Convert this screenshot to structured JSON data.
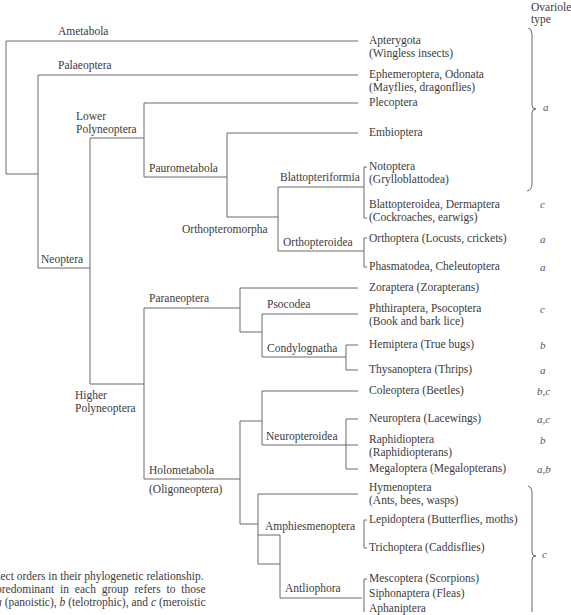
{
  "header": {
    "ovariole_type_line1": "Ovariole",
    "ovariole_type_line2": "type"
  },
  "clades": {
    "ametabola": "Ametabola",
    "palaeoptera": "Palaeoptera",
    "neoptera": "Neoptera",
    "lower_polyneoptera_1": "Lower",
    "lower_polyneoptera_2": "Polyneoptera",
    "paurometabola": "Paurometabola",
    "orthopteromorpha": "Orthopteromorpha",
    "blattopteriformia": "Blattopteriformia",
    "orthopteroidea": "Orthopteroidea",
    "higher_polyneoptera_1": "Higher",
    "higher_polyneoptera_2": "Polyneoptera",
    "paraneoptera": "Paraneoptera",
    "psocodea": "Psocodea",
    "condylognatha": "Condylognatha",
    "holometabola": "Holometabola",
    "oligoneoptera": "(Oligoneoptera)",
    "neuropteroidea": "Neuropteroidea",
    "amphiesmenoptera": "Amphiesmenoptera",
    "antliophora": "Antliophora"
  },
  "taxa": [
    {
      "line1": "Apterygota",
      "line2": "(Wingless insects)",
      "ovariole": ""
    },
    {
      "line1": "Ephemeroptera, Odonata",
      "line2": "(Mayflies, dragonflies)",
      "ovariole": ""
    },
    {
      "line1": "Plecoptera",
      "line2": "",
      "ovariole": ""
    },
    {
      "line1": "Embioptera",
      "line2": "",
      "ovariole": ""
    },
    {
      "line1": "Notoptera",
      "line2": "(Grylloblattodea)",
      "ovariole": ""
    },
    {
      "line1": "Blattopteroidea, Dermaptera",
      "line2": "(Cockroaches, earwigs)",
      "ovariole": "c"
    },
    {
      "line1": "Orthoptera (Locusts, crickets)",
      "line2": "",
      "ovariole": "a"
    },
    {
      "line1": "Phasmatodea, Cheleutoptera",
      "line2": "",
      "ovariole": "a"
    },
    {
      "line1": "Zoraptera (Zorapterans)",
      "line2": "",
      "ovariole": ""
    },
    {
      "line1": "Phthiraptera, Psocoptera",
      "line2": "(Book and bark lice)",
      "ovariole": "c"
    },
    {
      "line1": "Hemiptera (True bugs)",
      "line2": "",
      "ovariole": "b"
    },
    {
      "line1": "Thysanoptera (Thrips)",
      "line2": "",
      "ovariole": "a"
    },
    {
      "line1": "Coleoptera (Beetles)",
      "line2": "",
      "ovariole": "b,c"
    },
    {
      "line1": "Neuroptera (Lacewings)",
      "line2": "",
      "ovariole": "a,c"
    },
    {
      "line1": "Raphidioptera",
      "line2": "(Raphidiopterans)",
      "ovariole": "b"
    },
    {
      "line1": "Megaloptera (Megalopterans)",
      "line2": "",
      "ovariole": "a,b"
    },
    {
      "line1": "Hymenoptera",
      "line2": "(Ants, bees, wasps)",
      "ovariole": ""
    },
    {
      "line1": "Lepidoptera (Butterflies, moths)",
      "line2": "",
      "ovariole": ""
    },
    {
      "line1": "Trichoptera (Caddisflies)",
      "line2": "",
      "ovariole": ""
    },
    {
      "line1": "Mescoptera (Scorpions)",
      "line2": "",
      "ovariole": ""
    },
    {
      "line1": "Siphonaptera (Fleas)",
      "line2": "",
      "ovariole": ""
    },
    {
      "line1": "Aphaniptera",
      "line2": "",
      "ovariole": ""
    }
  ],
  "braces": [
    {
      "label": "a",
      "covers": "Apterygota through Notoptera"
    },
    {
      "label": "c",
      "covers": "Hymenoptera through Aphaniptera"
    }
  ],
  "caption": {
    "line1": "sect orders in their phylogenetic relationship.",
    "line2": "predominant in each group refers to those",
    "line3_a": "a",
    "line3_a_text": " (panoistic), ",
    "line3_b": "b",
    "line3_b_text": " (telotrophic), and ",
    "line3_c": "c",
    "line3_c_text": " (meroistic"
  }
}
